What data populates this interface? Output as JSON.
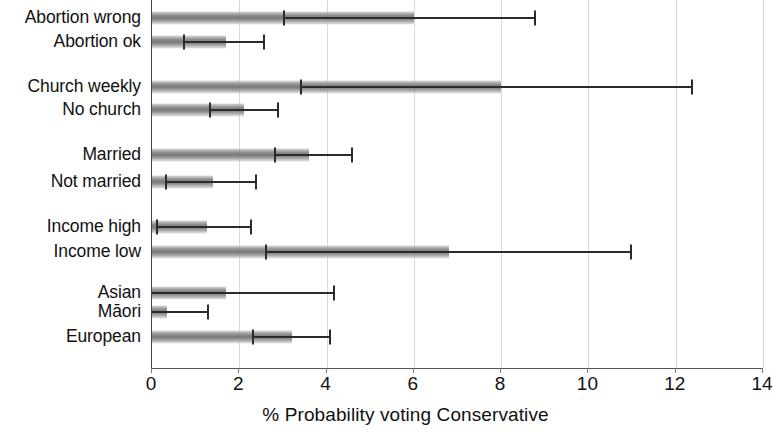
{
  "chart_data": {
    "type": "bar",
    "orientation": "horizontal",
    "title": "",
    "xlabel": "% Probability voting Conservative",
    "ylabel": "",
    "xlim": [
      0,
      14
    ],
    "xticks": [
      0,
      2,
      4,
      6,
      8,
      10,
      12,
      14
    ],
    "xtick_labels": [
      "0",
      "2",
      "4",
      "6",
      "8",
      "10",
      "12",
      "14"
    ],
    "grid": true,
    "legend": "none",
    "error_bars": "95% confidence interval",
    "groups": [
      {
        "name": "Abortion attitude",
        "rows": [
          {
            "category": "Abortion wrong",
            "value": 6.0,
            "ci_low": 3.0,
            "ci_high": 8.8
          },
          {
            "category": "Abortion ok",
            "value": 1.7,
            "ci_low": 0.7,
            "ci_high": 2.6
          }
        ]
      },
      {
        "name": "Church attendance",
        "rows": [
          {
            "category": "Church weekly",
            "value": 8.0,
            "ci_low": 3.4,
            "ci_high": 12.4
          },
          {
            "category": "No church",
            "value": 2.1,
            "ci_low": 1.3,
            "ci_high": 2.9
          }
        ]
      },
      {
        "name": "Marital status",
        "rows": [
          {
            "category": "Married",
            "value": 3.6,
            "ci_low": 2.8,
            "ci_high": 4.6
          },
          {
            "category": "Not married",
            "value": 1.4,
            "ci_low": 0.3,
            "ci_high": 2.4
          }
        ]
      },
      {
        "name": "Income",
        "rows": [
          {
            "category": "Income high",
            "value": 1.25,
            "ci_low": 0.1,
            "ci_high": 2.3
          },
          {
            "category": "Income low",
            "value": 6.8,
            "ci_low": 2.6,
            "ci_high": 11.0
          }
        ]
      },
      {
        "name": "Ethnicity",
        "rows": [
          {
            "category": "Asian",
            "value": 1.7,
            "ci_low": 0.0,
            "ci_high": 4.2
          },
          {
            "category": "Māori",
            "value": 0.35,
            "ci_low": 0.0,
            "ci_high": 1.3
          },
          {
            "category": "European",
            "value": 3.2,
            "ci_low": 2.3,
            "ci_high": 4.1
          }
        ]
      }
    ],
    "row_y_px": [
      18,
      42,
      87,
      110,
      155,
      182,
      227,
      252,
      293,
      312,
      337
    ]
  }
}
